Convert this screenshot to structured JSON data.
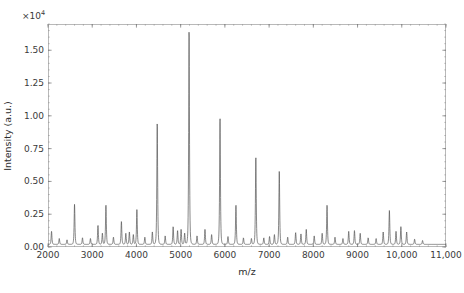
{
  "chart_data": {
    "type": "line",
    "title": "",
    "subtitle": "",
    "xlabel": "m/z",
    "ylabel": "Intensity (a.u.)",
    "y_multiplier_text": "×10",
    "y_multiplier_exponent": "4",
    "y_multiplier_value": 10000,
    "xlim": [
      2000,
      11000
    ],
    "ylim": [
      0,
      1.7
    ],
    "grid": false,
    "legend": null,
    "legend_position": "none",
    "xticks": [
      2000,
      3000,
      4000,
      5000,
      6000,
      7000,
      8000,
      9000,
      10000,
      11000
    ],
    "xtick_labels": [
      "2000",
      "3000",
      "4000",
      "5000",
      "6000",
      "7000",
      "8000",
      "9000",
      "10,000",
      "11,000"
    ],
    "yticks": [
      0.0,
      0.25,
      0.5,
      0.75,
      1.0,
      1.25,
      1.5
    ],
    "ytick_labels": [
      "0.00",
      "0.25",
      "0.50",
      "0.75",
      "1.00",
      "1.25",
      "1.50"
    ],
    "x_minor_tick_step": 200,
    "y_minor_tick_step": 0.05,
    "trace_color": "#555555",
    "frame_color": "#b9b9b9",
    "text_color": "#333333",
    "baseline": 0.02,
    "peak_width": 26,
    "peaks": [
      {
        "x": 2080,
        "y": 0.1
      },
      {
        "x": 2255,
        "y": 0.045
      },
      {
        "x": 2430,
        "y": 0.035
      },
      {
        "x": 2600,
        "y": 0.305
      },
      {
        "x": 2780,
        "y": 0.05
      },
      {
        "x": 2960,
        "y": 0.045
      },
      {
        "x": 3130,
        "y": 0.145
      },
      {
        "x": 3230,
        "y": 0.085
      },
      {
        "x": 3310,
        "y": 0.3
      },
      {
        "x": 3480,
        "y": 0.055
      },
      {
        "x": 3660,
        "y": 0.175
      },
      {
        "x": 3760,
        "y": 0.085
      },
      {
        "x": 3840,
        "y": 0.095
      },
      {
        "x": 3930,
        "y": 0.075
      },
      {
        "x": 4010,
        "y": 0.265
      },
      {
        "x": 4190,
        "y": 0.055
      },
      {
        "x": 4360,
        "y": 0.095
      },
      {
        "x": 4470,
        "y": 0.925
      },
      {
        "x": 4650,
        "y": 0.065
      },
      {
        "x": 4830,
        "y": 0.135
      },
      {
        "x": 4930,
        "y": 0.105
      },
      {
        "x": 5010,
        "y": 0.115
      },
      {
        "x": 5090,
        "y": 0.085
      },
      {
        "x": 5190,
        "y": 1.63
      },
      {
        "x": 5370,
        "y": 0.065
      },
      {
        "x": 5550,
        "y": 0.115
      },
      {
        "x": 5700,
        "y": 0.075
      },
      {
        "x": 5890,
        "y": 0.965
      },
      {
        "x": 6070,
        "y": 0.06
      },
      {
        "x": 6250,
        "y": 0.3
      },
      {
        "x": 6420,
        "y": 0.05
      },
      {
        "x": 6600,
        "y": 0.045
      },
      {
        "x": 6700,
        "y": 0.665
      },
      {
        "x": 6880,
        "y": 0.05
      },
      {
        "x": 7010,
        "y": 0.06
      },
      {
        "x": 7120,
        "y": 0.075
      },
      {
        "x": 7230,
        "y": 0.56
      },
      {
        "x": 7420,
        "y": 0.055
      },
      {
        "x": 7600,
        "y": 0.09
      },
      {
        "x": 7720,
        "y": 0.08
      },
      {
        "x": 7840,
        "y": 0.115
      },
      {
        "x": 8020,
        "y": 0.065
      },
      {
        "x": 8200,
        "y": 0.085
      },
      {
        "x": 8310,
        "y": 0.3
      },
      {
        "x": 8490,
        "y": 0.055
      },
      {
        "x": 8670,
        "y": 0.045
      },
      {
        "x": 8800,
        "y": 0.1
      },
      {
        "x": 8930,
        "y": 0.105
      },
      {
        "x": 9060,
        "y": 0.085
      },
      {
        "x": 9240,
        "y": 0.05
      },
      {
        "x": 9420,
        "y": 0.045
      },
      {
        "x": 9580,
        "y": 0.095
      },
      {
        "x": 9720,
        "y": 0.26
      },
      {
        "x": 9870,
        "y": 0.1
      },
      {
        "x": 9980,
        "y": 0.135
      },
      {
        "x": 10110,
        "y": 0.095
      },
      {
        "x": 10290,
        "y": 0.04
      },
      {
        "x": 10470,
        "y": 0.03
      }
    ]
  }
}
